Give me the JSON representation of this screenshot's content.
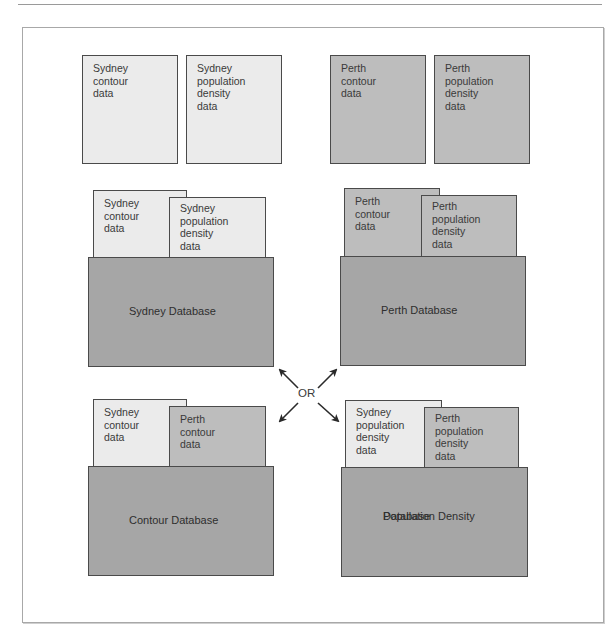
{
  "diagram": {
    "title": "",
    "colors": {
      "sydney_card": "#ebebeb",
      "perth_card": "#bdbdbd",
      "database": "#a6a6a6",
      "border": "#4a4a4a"
    },
    "top_row": [
      {
        "lines": [
          "Sydney",
          "contour",
          "data"
        ],
        "city": "Sydney"
      },
      {
        "lines": [
          "Sydney",
          "population",
          "density",
          "data"
        ],
        "city": "Sydney"
      },
      {
        "lines": [
          "Perth",
          "contour",
          "data"
        ],
        "city": "Perth"
      },
      {
        "lines": [
          "Perth",
          "population",
          "density",
          "data"
        ],
        "city": "Perth"
      }
    ],
    "databases": [
      {
        "label_lines": [
          "Sydney Database"
        ],
        "cards": [
          {
            "lines": [
              "Sydney",
              "contour",
              "data"
            ]
          },
          {
            "lines": [
              "Sydney",
              "population",
              "density",
              "data"
            ]
          }
        ]
      },
      {
        "label_lines": [
          "Perth Database"
        ],
        "cards": [
          {
            "lines": [
              "Perth",
              "contour",
              "data"
            ]
          },
          {
            "lines": [
              "Perth",
              "population",
              "density",
              "data"
            ]
          }
        ]
      },
      {
        "label_lines": [
          "Contour Database"
        ],
        "cards": [
          {
            "lines": [
              "Sydney",
              "contour",
              "data"
            ]
          },
          {
            "lines": [
              "Perth",
              "contour",
              "data"
            ]
          }
        ]
      },
      {
        "label_lines": [
          "Population Density",
          "Database"
        ],
        "cards": [
          {
            "lines": [
              "Sydney",
              "population",
              "density",
              "data"
            ]
          },
          {
            "lines": [
              "Perth",
              "population",
              "density",
              "data"
            ]
          }
        ]
      }
    ],
    "connector": {
      "label": "OR",
      "icon": "four-way-arrow-icon"
    }
  }
}
